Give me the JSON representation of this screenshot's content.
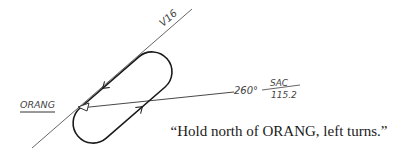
{
  "diagram": {
    "airway": {
      "label": "V16"
    },
    "fix": {
      "label": "ORANG"
    },
    "radial": {
      "bearing": "260°",
      "station": "SAC",
      "frequency": "115.2"
    },
    "caption": "“Hold north of ORANG, left turns.”",
    "colors": {
      "line": "#555555",
      "track": "#1a1a1a",
      "text": "#444444"
    }
  }
}
